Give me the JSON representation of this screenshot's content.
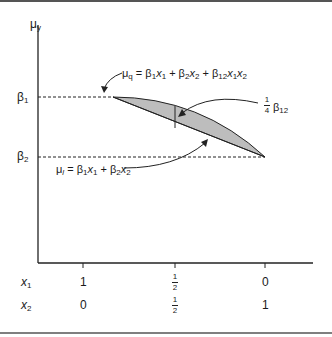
{
  "axes": {
    "y_label": "μ",
    "y_label_sub": "y",
    "y_ticks": [
      {
        "label": "β",
        "sub": "1"
      },
      {
        "label": "β",
        "sub": "2"
      }
    ]
  },
  "x_rows": [
    {
      "var": "x",
      "sub": "1",
      "values": [
        "1",
        "1/2",
        "0"
      ]
    },
    {
      "var": "x",
      "sub": "2",
      "values": [
        "0",
        "1/2",
        "1"
      ]
    }
  ],
  "annotations": {
    "quadratic": "μq = β1x1 + β2x2 + β12x1x2",
    "linear": "μl = β1x1 + β2x2",
    "gap": "¼ β12"
  },
  "frac": {
    "num": "1",
    "den": "2",
    "quarter_num": "1",
    "quarter_den": "4"
  },
  "colors": {
    "fill": "#bdbdbd",
    "line": "#1a1a1a"
  }
}
